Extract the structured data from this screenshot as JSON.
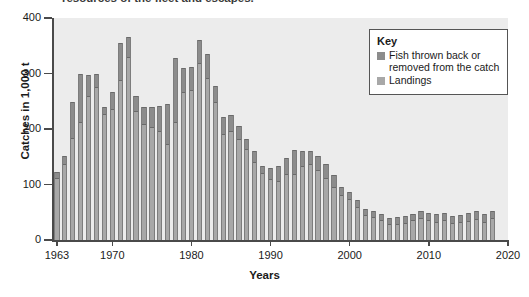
{
  "top_fragment": "resources of the fleet and escapes.",
  "chart_data": {
    "type": "bar",
    "subtype": "stacked-bar",
    "title": "",
    "xlabel": "Years",
    "ylabel": "Catches in 1,000 t",
    "ylim": [
      0,
      400
    ],
    "yticks": [
      0,
      100,
      200,
      300,
      400
    ],
    "xlim": [
      1962.5,
      2020
    ],
    "xticks": [
      1963,
      1970,
      1980,
      1990,
      2000,
      2010,
      2020
    ],
    "xtick_labels": [
      "1963",
      "1970",
      "1980",
      "1990",
      "2000",
      "2010",
      "2020"
    ],
    "grid": false,
    "legend_position": "top-right",
    "legend_title": "Key",
    "series": [
      {
        "name": "Landings",
        "color": "#a8a8a8",
        "values": [
          113,
          138,
          186,
          215,
          262,
          278,
          229,
          238,
          291,
          331,
          234,
          210,
          205,
          199,
          174,
          214,
          268,
          272,
          320,
          293,
          250,
          192,
          198,
          184,
          165,
          143,
          122,
          112,
          108,
          120,
          121,
          136,
          139,
          128,
          113,
          98,
          83,
          76,
          61,
          46,
          43,
          38,
          30,
          31,
          33,
          37,
          41,
          38,
          35,
          37,
          33,
          34,
          36,
          39,
          35,
          41
        ]
      },
      {
        "name": "Fish thrown back or removed from the catch",
        "color": "#8c8c8c",
        "values": [
          10,
          13,
          62,
          84,
          36,
          22,
          11,
          28,
          64,
          35,
          25,
          30,
          35,
          42,
          71,
          114,
          42,
          39,
          41,
          42,
          28,
          30,
          27,
          21,
          17,
          17,
          11,
          18,
          25,
          27,
          41,
          24,
          22,
          23,
          24,
          19,
          13,
          11,
          12,
          10,
          9,
          8,
          9,
          10,
          10,
          10,
          11,
          10,
          11,
          12,
          11,
          11,
          12,
          13,
          12,
          11
        ]
      }
    ],
    "categories": [
      1963,
      1964,
      1965,
      1966,
      1967,
      1968,
      1969,
      1970,
      1971,
      1972,
      1973,
      1974,
      1975,
      1976,
      1977,
      1978,
      1979,
      1980,
      1981,
      1982,
      1983,
      1984,
      1985,
      1986,
      1987,
      1988,
      1989,
      1990,
      1991,
      1992,
      1993,
      1994,
      1995,
      1996,
      1997,
      1998,
      1999,
      2000,
      2001,
      2002,
      2003,
      2004,
      2005,
      2006,
      2007,
      2008,
      2009,
      2010,
      2011,
      2012,
      2013,
      2014,
      2015,
      2016,
      2017,
      2018
    ],
    "totals": [
      123,
      151,
      248,
      299,
      298,
      300,
      240,
      266,
      355,
      366,
      259,
      240,
      240,
      241,
      245,
      328,
      310,
      311,
      361,
      335,
      278,
      222,
      225,
      205,
      182,
      160,
      133,
      130,
      133,
      147,
      162,
      160,
      161,
      151,
      137,
      117,
      96,
      87,
      73,
      56,
      52,
      46,
      39,
      41,
      43,
      47,
      52,
      48,
      46,
      49,
      44,
      45,
      48,
      52,
      47,
      52
    ]
  },
  "legend": {
    "title": "Key",
    "items": [
      {
        "label": "Fish thrown back or removed from the catch",
        "color": "#8c8c8c"
      },
      {
        "label": "Landings",
        "color": "#a8a8a8"
      }
    ]
  }
}
